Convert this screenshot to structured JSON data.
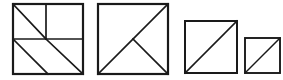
{
  "diagram": {
    "background_color": "#ffffff",
    "stroke_color": "#1a1a1a",
    "canvas": {
      "width": 283,
      "height": 80
    },
    "figure_count": 4,
    "figures": [
      {
        "id": "figure-1",
        "name": "square-divided-four-regions",
        "label": "Square 1",
        "x": 13,
        "y": 4,
        "size": 70,
        "outline_stroke_width": 2.2,
        "inner_stroke_width": 1.7,
        "description": "Square with full horizontal midline, a vertical half-line in the upper half, and three parallel diagonals running top-left to bottom-right",
        "lines": [
          {
            "name": "horizontal-midline",
            "x1": 0,
            "y1": 35,
            "x2": 70,
            "y2": 35
          },
          {
            "name": "vertical-upper-half-line",
            "x1": 33,
            "y1": 0,
            "x2": 33,
            "y2": 35
          },
          {
            "name": "diagonal-upper-left-quadrant",
            "x1": 0,
            "y1": 0,
            "x2": 33,
            "y2": 35
          },
          {
            "name": "diagonal-lower-long",
            "x1": 33,
            "y1": 35,
            "x2": 70,
            "y2": 70
          },
          {
            "name": "diagonal-lower-left-quadrant",
            "x1": 0,
            "y1": 35,
            "x2": 35,
            "y2": 70
          }
        ]
      },
      {
        "id": "figure-2",
        "name": "square-with-anti-diagonal-and-v-wedge",
        "label": "Square 2",
        "x": 98,
        "y": 4,
        "size": 70,
        "outline_stroke_width": 2.2,
        "inner_stroke_width": 1.7,
        "description": "Square with a full anti-diagonal from bottom-left to top-right plus a line from the center to the bottom-right corner forming a V",
        "lines": [
          {
            "name": "anti-diagonal",
            "x1": 0,
            "y1": 70,
            "x2": 70,
            "y2": 0
          },
          {
            "name": "center-to-bottom-right",
            "x1": 35,
            "y1": 35,
            "x2": 70,
            "y2": 70
          }
        ]
      },
      {
        "id": "figure-3",
        "name": "square-with-anti-diagonal-medium",
        "label": "Square 3",
        "x": 185,
        "y": 21,
        "size": 52,
        "outline_stroke_width": 2.0,
        "inner_stroke_width": 1.6,
        "description": "Medium square split by a single anti-diagonal from bottom-left to top-right",
        "lines": [
          {
            "name": "anti-diagonal",
            "x1": 0,
            "y1": 52,
            "x2": 52,
            "y2": 0
          }
        ]
      },
      {
        "id": "figure-4",
        "name": "square-with-anti-diagonal-small",
        "label": "Square 4",
        "x": 245,
        "y": 38,
        "size": 35,
        "outline_stroke_width": 1.9,
        "inner_stroke_width": 1.5,
        "description": "Small square split by a single anti-diagonal from bottom-left to top-right",
        "lines": [
          {
            "name": "anti-diagonal",
            "x1": 0,
            "y1": 35,
            "x2": 35,
            "y2": 0
          }
        ]
      }
    ]
  }
}
